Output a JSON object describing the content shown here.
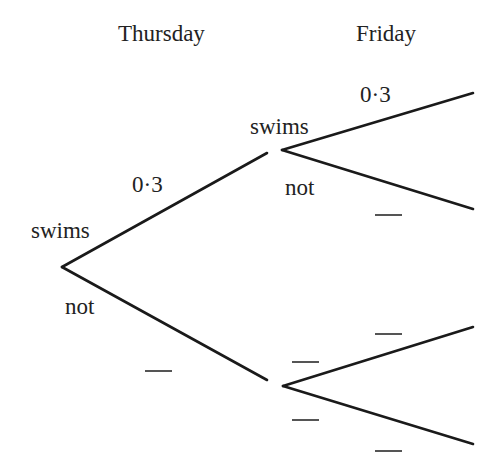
{
  "headers": {
    "day1": "Thursday",
    "day2": "Friday"
  },
  "thursday": {
    "upper_outcome": "swims",
    "lower_outcome": "not",
    "upper_probability": "0·3",
    "lower_probability": ""
  },
  "friday_after_swims": {
    "upper_outcome": "swims",
    "lower_outcome": "not",
    "upper_probability": "0·3",
    "lower_probability": ""
  },
  "friday_after_not": {
    "upper_outcome": "",
    "lower_outcome": "",
    "upper_probability": "",
    "lower_probability": ""
  },
  "colors": {
    "line": "#1a1a1a",
    "text": "#222222",
    "blank": "#555555",
    "background": "#ffffff"
  }
}
